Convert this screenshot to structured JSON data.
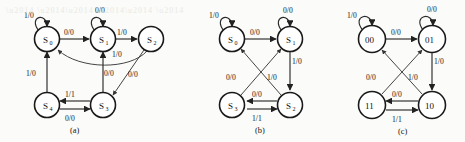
{
  "figure": {
    "background_color": "#fbfbf9",
    "ink_color": "#1a1a1a",
    "type": "state-transition-diagram-set",
    "panel_count": 3
  },
  "captions": {
    "a": "(a)",
    "b": "(b)",
    "c": "(c)"
  },
  "panels": [
    {
      "id": "a",
      "caption": "(a)",
      "states": [
        {
          "key": "s0",
          "base": "S",
          "sub": "0",
          "cx": 47,
          "cy": 39,
          "r": 12.5
        },
        {
          "key": "s1",
          "base": "S",
          "sub": "1",
          "cx": 103,
          "cy": 39,
          "r": 12.5
        },
        {
          "key": "s2",
          "base": "S",
          "sub": "2",
          "cx": 151,
          "cy": 39,
          "r": 12.5
        },
        {
          "key": "s4",
          "base": "S",
          "sub": "4",
          "cx": 47,
          "cy": 105,
          "r": 12.5
        },
        {
          "key": "s3",
          "base": "S",
          "sub": "3",
          "cx": 103,
          "cy": 105,
          "r": 12.5
        }
      ],
      "transitions": [
        {
          "from": "s0",
          "to": "s0",
          "label": "1/0",
          "kind": "self-loop"
        },
        {
          "from": "s1",
          "to": "s1",
          "label": "0/0",
          "kind": "self-loop"
        },
        {
          "from": "s0",
          "to": "s1",
          "label": "0/0",
          "kind": "straight"
        },
        {
          "from": "s1",
          "to": "s2",
          "label": "1/0",
          "kind": "straight"
        },
        {
          "from": "s2",
          "to": "s0",
          "label": "1/0",
          "kind": "curve"
        },
        {
          "from": "s2",
          "to": "s3",
          "label": "0/0",
          "kind": "straight"
        },
        {
          "from": "s3",
          "to": "s1",
          "label": "0/0",
          "kind": "straight"
        },
        {
          "from": "s4",
          "to": "s0",
          "label": "1/0",
          "kind": "straight"
        },
        {
          "from": "s3",
          "to": "s4",
          "label": "1/1",
          "kind": "straight"
        },
        {
          "from": "s4",
          "to": "s3",
          "label": "0/0",
          "kind": "straight"
        }
      ]
    },
    {
      "id": "b",
      "caption": "(b)",
      "states": [
        {
          "key": "s0",
          "base": "S",
          "sub": "0",
          "cx": 232,
          "cy": 39,
          "r": 12.5
        },
        {
          "key": "s1",
          "base": "S",
          "sub": "1",
          "cx": 290,
          "cy": 39,
          "r": 12.5
        },
        {
          "key": "s3",
          "base": "S",
          "sub": "3",
          "cx": 232,
          "cy": 105,
          "r": 12.5
        },
        {
          "key": "s2",
          "base": "S",
          "sub": "2",
          "cx": 290,
          "cy": 105,
          "r": 12.5
        }
      ],
      "transitions": [
        {
          "from": "s0",
          "to": "s0",
          "label": "1/0",
          "kind": "self-loop"
        },
        {
          "from": "s1",
          "to": "s1",
          "label": "0/0",
          "kind": "self-loop"
        },
        {
          "from": "s0",
          "to": "s1",
          "label": "0/0",
          "kind": "straight"
        },
        {
          "from": "s1",
          "to": "s2",
          "label": "1/0",
          "kind": "straight"
        },
        {
          "from": "s2",
          "to": "s0",
          "label": "1/0",
          "kind": "diagonal"
        },
        {
          "from": "s3",
          "to": "s1",
          "label": "0/0",
          "kind": "diagonal"
        },
        {
          "from": "s2",
          "to": "s3",
          "label": "0/0",
          "kind": "straight"
        },
        {
          "from": "s3",
          "to": "s2",
          "label": "1/1",
          "kind": "straight"
        }
      ]
    },
    {
      "id": "c",
      "caption": "(c)",
      "states": [
        {
          "key": "n00",
          "base": "00",
          "sub": "",
          "cx": 372,
          "cy": 39,
          "r": 13.5
        },
        {
          "key": "n01",
          "base": "01",
          "sub": "",
          "cx": 432,
          "cy": 39,
          "r": 13.5
        },
        {
          "key": "n11",
          "base": "11",
          "sub": "",
          "cx": 372,
          "cy": 105,
          "r": 13.5
        },
        {
          "key": "n10",
          "base": "10",
          "sub": "",
          "cx": 432,
          "cy": 105,
          "r": 13.5
        }
      ],
      "transitions": [
        {
          "from": "n00",
          "to": "n00",
          "label": "1/0",
          "kind": "self-loop"
        },
        {
          "from": "n01",
          "to": "n01",
          "label": "0/0",
          "kind": "self-loop"
        },
        {
          "from": "n00",
          "to": "n01",
          "label": "0/0",
          "kind": "straight"
        },
        {
          "from": "n01",
          "to": "n10",
          "label": "1/0",
          "kind": "straight"
        },
        {
          "from": "n10",
          "to": "n00",
          "label": "1/0",
          "kind": "diagonal"
        },
        {
          "from": "n11",
          "to": "n01",
          "label": "0/0",
          "kind": "diagonal"
        },
        {
          "from": "n10",
          "to": "n11",
          "label": "0/0",
          "kind": "straight"
        },
        {
          "from": "n11",
          "to": "n10",
          "label": "1/1",
          "kind": "straight"
        }
      ]
    }
  ],
  "labels": {
    "a": {
      "s0_self": "1/0",
      "s1_self": "0/0",
      "s0_s1": "0/0",
      "s1_s2": "1/0",
      "s2_s0": "1/0",
      "s2_s3": "0/0",
      "s3_s1": "0/0",
      "s4_s0": "1/0",
      "s3_s4": "1/1",
      "s4_s3": "0/0"
    },
    "b": {
      "s0_self": "1/0",
      "s1_self": "0/0",
      "s0_s1": "0/0",
      "s1_s2": "1/0",
      "s2_s0": "1/0",
      "s3_s1": "0/0",
      "s2_s3": "0/0",
      "s3_s2": "1/1"
    },
    "c": {
      "n00_self": "1/0",
      "n01_self": "0/0",
      "n00_n01": "0/0",
      "n01_n10": "1/0",
      "n10_n00": "1/0",
      "n11_n01": "0/0",
      "n10_n11": "0/0",
      "n11_n10": "1/1"
    }
  },
  "state_names": {
    "a": {
      "s0": "S",
      "s0s": "0",
      "s1": "S",
      "s1s": "1",
      "s2": "S",
      "s2s": "2",
      "s3": "S",
      "s3s": "3",
      "s4": "S",
      "s4s": "4"
    },
    "b": {
      "s0": "S",
      "s0s": "0",
      "s1": "S",
      "s1s": "1",
      "s2": "S",
      "s2s": "2",
      "s3": "S",
      "s3s": "3"
    },
    "c": {
      "n00": "00",
      "n01": "01",
      "n11": "11",
      "n10": "10"
    }
  }
}
